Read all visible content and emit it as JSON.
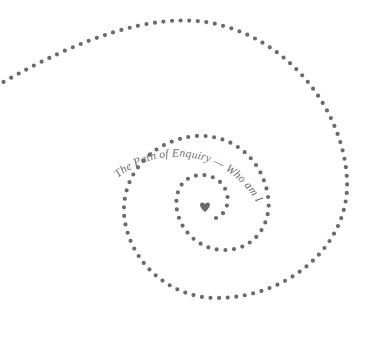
{
  "caption": {
    "text": "The Path of Enquiry — Who am I…"
  },
  "graphic": {
    "dot_color": "#6b6b6b",
    "text_color": "#6e6e6e",
    "background": "#ffffff",
    "center_icon": "heart-icon"
  }
}
